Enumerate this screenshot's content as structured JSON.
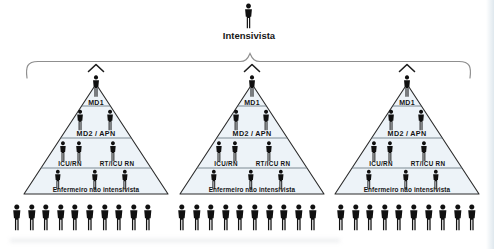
{
  "figure": {
    "title": "Intensivista",
    "pyramid_fill": "#edf3f8",
    "brace_color": "#8f8f8f",
    "icon_color": "#101010"
  },
  "pyramids": [
    {
      "level1_label": "MD1",
      "level2_label": "MD2 / APN",
      "level3_left_label": "ICU/RN",
      "level3_right_label": "RT/ICU RN",
      "level4_label": "Enfermeiro não intensivista"
    },
    {
      "level1_label": "MD1",
      "level2_label": "MD2 / APN",
      "level3_left_label": "ICU/RN",
      "level3_right_label": "RT/ICU RN",
      "level4_label": "Enfermeiro não intensivista"
    },
    {
      "level1_label": "MD1",
      "level2_label": "MD2 / APN",
      "level3_left_label": "ICU/RN",
      "level3_right_label": "RT/ICU RN",
      "level4_label": "Enfermeiro não intensivista"
    }
  ],
  "crowd_rows": {
    "groups": [
      {
        "person_count": 10
      },
      {
        "person_count": 10
      },
      {
        "person_count": 10
      }
    ]
  }
}
